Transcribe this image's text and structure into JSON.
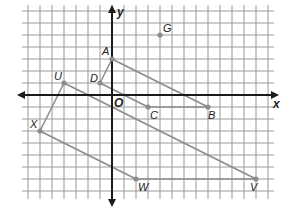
{
  "diagram": {
    "type": "coordinate-grid",
    "grid": {
      "unit_px": 12,
      "origin_px": [
        112,
        95
      ],
      "x_range": [
        -7,
        13
      ],
      "y_range": [
        -8,
        7
      ],
      "grid_color": "#9a9a9a",
      "axis_color": "#1a1a1a"
    },
    "axes": {
      "x_label": "x",
      "y_label": "y",
      "origin_label": "O"
    },
    "points": [
      {
        "name": "A",
        "x": 0,
        "y": 3,
        "label_dx": -10,
        "label_dy": -4
      },
      {
        "name": "D",
        "x": -1,
        "y": 1,
        "label_dx": -10,
        "label_dy": -1
      },
      {
        "name": "C",
        "x": 3,
        "y": -1,
        "label_dx": 2,
        "label_dy": 12
      },
      {
        "name": "B",
        "x": 8,
        "y": -1,
        "label_dx": 0,
        "label_dy": 12
      },
      {
        "name": "G",
        "x": 4,
        "y": 5,
        "label_dx": 3,
        "label_dy": -3
      },
      {
        "name": "U",
        "x": -4,
        "y": 1,
        "label_dx": -10,
        "label_dy": -3
      },
      {
        "name": "X",
        "x": -6,
        "y": -3,
        "label_dx": -10,
        "label_dy": -3
      },
      {
        "name": "W",
        "x": 2,
        "y": -7,
        "label_dx": 2,
        "label_dy": 12
      },
      {
        "name": "V",
        "x": 12,
        "y": -7,
        "label_dx": -6,
        "label_dy": 12
      }
    ],
    "segments": [
      [
        "A",
        "D"
      ],
      [
        "D",
        "C"
      ],
      [
        "C",
        "B"
      ],
      [
        "B",
        "A"
      ],
      [
        "U",
        "X"
      ],
      [
        "X",
        "W"
      ],
      [
        "W",
        "V"
      ],
      [
        "V",
        "U"
      ]
    ],
    "segment_color": "#8c8c8c",
    "point_color": "#8c8c8c"
  }
}
